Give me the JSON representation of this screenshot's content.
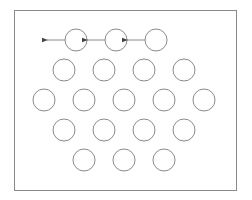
{
  "diagram": {
    "colors": {
      "background": "#ffffff",
      "frame": "#8a8a8a",
      "circle_stroke": "#8a8a8a",
      "arrow": "#555555"
    },
    "frame": {
      "x": 14,
      "y": 10,
      "width": 222,
      "height": 180
    },
    "circle_radius": 11,
    "rows": [
      {
        "y": 40,
        "x": [
          76,
          116,
          156
        ],
        "arrows": true
      },
      {
        "y": 70,
        "x": [
          64,
          104,
          144,
          184
        ],
        "arrows": false
      },
      {
        "y": 100,
        "x": [
          44,
          84,
          124,
          164,
          204
        ],
        "arrows": false
      },
      {
        "y": 130,
        "x": [
          64,
          104,
          144,
          184
        ],
        "arrows": false
      },
      {
        "y": 160,
        "x": [
          84,
          124,
          164
        ],
        "arrows": false
      }
    ],
    "arrow_length": 18,
    "arrow_direction": "left"
  }
}
